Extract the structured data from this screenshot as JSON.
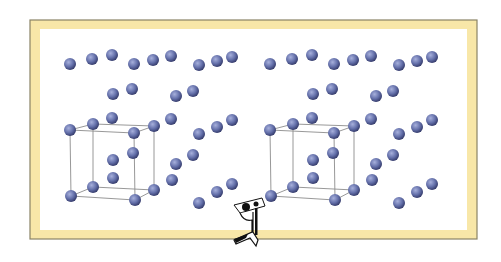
{
  "diagram": {
    "title": "",
    "frame": {
      "x": 30,
      "y": 20,
      "width": 447,
      "height": 219,
      "border_color": "#f8e7a8",
      "edge_color": "#8a8466",
      "border_width": 9
    },
    "atom": {
      "radius": 6,
      "color_light": "#a7b0dc",
      "color_mid": "#6470aa",
      "color_dark": "#2f3564"
    },
    "cube_line_color": "#8c8c8c",
    "panel_offset_x": 200,
    "atoms": [
      [
        70,
        64
      ],
      [
        92,
        59
      ],
      [
        112,
        55
      ],
      [
        134,
        64
      ],
      [
        153,
        60
      ],
      [
        171,
        56
      ],
      [
        199,
        65
      ],
      [
        217,
        61
      ],
      [
        232,
        57
      ],
      [
        113,
        94
      ],
      [
        132,
        89
      ],
      [
        176,
        96
      ],
      [
        193,
        91
      ],
      [
        70,
        130
      ],
      [
        93,
        124
      ],
      [
        112,
        118
      ],
      [
        134,
        133
      ],
      [
        154,
        126
      ],
      [
        171,
        119
      ],
      [
        133,
        153
      ],
      [
        113,
        160
      ],
      [
        113,
        178
      ],
      [
        93,
        187
      ],
      [
        71,
        196
      ],
      [
        135,
        200
      ],
      [
        154,
        190
      ],
      [
        199,
        134
      ],
      [
        217,
        127
      ],
      [
        232,
        120
      ],
      [
        176,
        164
      ],
      [
        193,
        155
      ],
      [
        172,
        180
      ],
      [
        199,
        203
      ],
      [
        217,
        192
      ],
      [
        232,
        184
      ]
    ],
    "cube_edges": [
      [
        [
          70,
          130
        ],
        [
          134,
          133
        ]
      ],
      [
        [
          134,
          133
        ],
        [
          154,
          126
        ]
      ],
      [
        [
          154,
          126
        ],
        [
          93,
          124
        ]
      ],
      [
        [
          93,
          124
        ],
        [
          70,
          130
        ]
      ],
      [
        [
          71,
          196
        ],
        [
          135,
          200
        ]
      ],
      [
        [
          135,
          200
        ],
        [
          154,
          190
        ]
      ],
      [
        [
          154,
          190
        ],
        [
          93,
          187
        ]
      ],
      [
        [
          93,
          187
        ],
        [
          71,
          196
        ]
      ],
      [
        [
          70,
          130
        ],
        [
          71,
          196
        ]
      ],
      [
        [
          134,
          133
        ],
        [
          135,
          200
        ]
      ],
      [
        [
          154,
          126
        ],
        [
          154,
          190
        ]
      ],
      [
        [
          93,
          124
        ],
        [
          93,
          187
        ]
      ]
    ],
    "logo": {
      "name": "publisher-logo",
      "x": 230,
      "y": 198
    }
  }
}
